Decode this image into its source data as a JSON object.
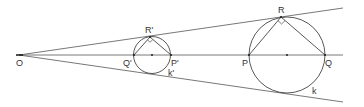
{
  "diagram": {
    "title": "",
    "colors": {
      "stroke": "#444444",
      "text": "#333333",
      "background": "#ffffff"
    },
    "labels": {
      "O": "O",
      "R_prime": "R'",
      "Q_prime": "Q'",
      "P_prime": "P'",
      "k_prime": "k'",
      "R": "R",
      "P": "P",
      "Q": "Q",
      "k": "k"
    },
    "points": {
      "O": [
        19,
        55
      ],
      "Q_prime": [
        134,
        55
      ],
      "P_prime": [
        171,
        55
      ],
      "R_prime": [
        150,
        37
      ],
      "center_small": [
        152,
        55
      ],
      "P": [
        249,
        55
      ],
      "Q": [
        325,
        55
      ],
      "R": [
        281,
        17
      ],
      "center_big": [
        287,
        55
      ]
    },
    "circles": [
      {
        "name": "k'",
        "center": [
          152,
          55
        ],
        "radius": 18.5
      },
      {
        "name": "k",
        "center": [
          287,
          55
        ],
        "radius": 38
      }
    ],
    "rays": [
      {
        "name": "upper-ray",
        "from": [
          19,
          55
        ],
        "to": [
          343,
          8
        ]
      },
      {
        "name": "axis",
        "from": [
          19,
          55
        ],
        "to": [
          343,
          55
        ]
      },
      {
        "name": "lower-ray",
        "from": [
          19,
          55
        ],
        "to": [
          343,
          102
        ]
      }
    ]
  }
}
